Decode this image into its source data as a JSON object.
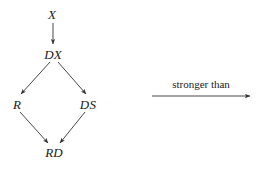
{
  "figure": {
    "type": "implication-diagram",
    "background_color": "#ffffff",
    "stroke_color": "#333333",
    "text_color": "#1a1a1a"
  },
  "nodes": [
    {
      "id": "X",
      "label": "X",
      "x": 52,
      "y": 15
    },
    {
      "id": "DX",
      "label": "DX",
      "x": 53,
      "y": 55
    },
    {
      "id": "R",
      "label": "R",
      "x": 17,
      "y": 105
    },
    {
      "id": "DS",
      "label": "DS",
      "x": 88,
      "y": 105
    },
    {
      "id": "RD",
      "label": "RD",
      "x": 54,
      "y": 153
    }
  ],
  "edges": [
    {
      "id": "x-to-dx",
      "from": "X",
      "to": "DX",
      "x1": 53,
      "y1": 23,
      "x2": 53,
      "y2": 44
    },
    {
      "id": "dx-to-r",
      "from": "DX",
      "to": "R",
      "x1": 50,
      "y1": 62,
      "x2": 21,
      "y2": 94
    },
    {
      "id": "dx-to-ds",
      "from": "DX",
      "to": "DS",
      "x1": 58,
      "y1": 62,
      "x2": 86,
      "y2": 94
    },
    {
      "id": "r-to-rd",
      "from": "R",
      "to": "RD",
      "x1": 20,
      "y1": 112,
      "x2": 48,
      "y2": 143
    },
    {
      "id": "ds-to-rd",
      "from": "DS",
      "to": "RD",
      "x1": 85,
      "y1": 112,
      "x2": 60,
      "y2": 143
    }
  ],
  "legend": {
    "label": "stronger than",
    "label_x": 201,
    "label_y": 84,
    "arrow": {
      "x1": 152,
      "y1": 96,
      "x2": 250,
      "y2": 96
    }
  }
}
